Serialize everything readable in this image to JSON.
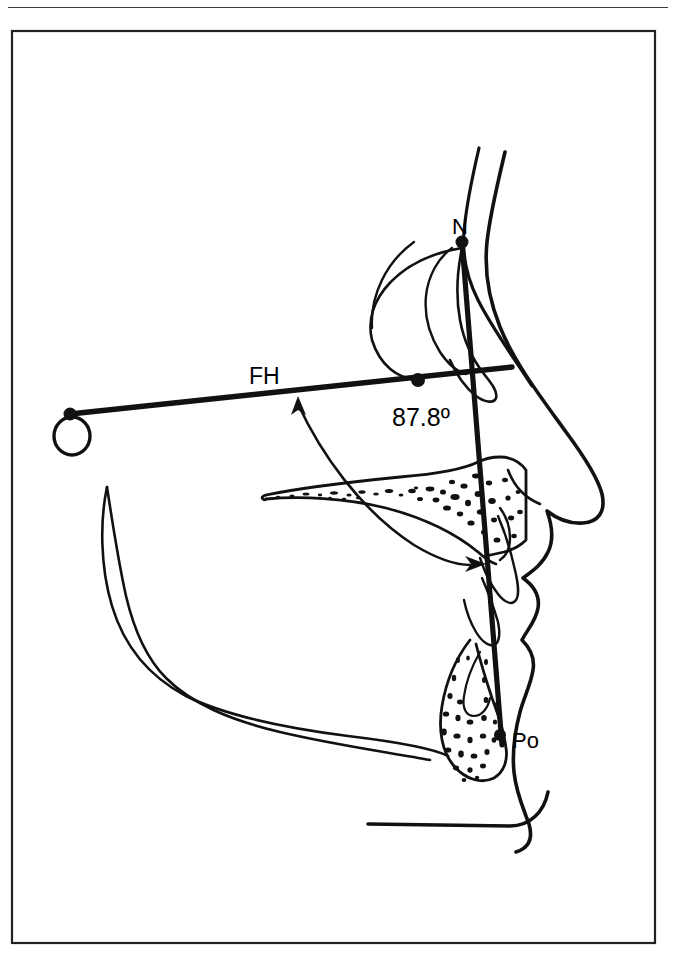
{
  "page": {
    "background_color": "#ffffff",
    "ink_color": "#111111",
    "header_rule": true,
    "frame": {
      "x": 12,
      "y": 31,
      "width": 643,
      "height": 912,
      "border_color": "#222222"
    }
  },
  "figure": {
    "kind": "cephalometric-lateral-tracing",
    "labels": [
      {
        "id": "n-label",
        "text": "N",
        "x": 452,
        "y": 234,
        "size": 22
      },
      {
        "id": "fh-label",
        "text": "FH",
        "x": 249,
        "y": 384,
        "size": 23
      },
      {
        "id": "angle-label",
        "text": "87.8º",
        "x": 392,
        "y": 426,
        "size": 25
      },
      {
        "id": "po-label",
        "text": "Po",
        "x": 512,
        "y": 748,
        "size": 22
      }
    ],
    "landmarks": [
      {
        "id": "nasion",
        "name": "N",
        "x": 462,
        "y": 242,
        "r": 6
      },
      {
        "id": "pogonion",
        "name": "Po",
        "x": 500,
        "y": 735,
        "r": 6
      },
      {
        "id": "fh-porion-end",
        "name": "FH-posterior",
        "x": 70,
        "y": 414,
        "r": 6
      },
      {
        "id": "fh-npo-intersection",
        "name": "FH-NPo crossing",
        "x": 418,
        "y": 380,
        "r": 7
      }
    ],
    "reference_lines": [
      {
        "id": "fh-plane",
        "name": "Frankfort Horizontal",
        "x1": 70,
        "y1": 414,
        "x2": 512,
        "y2": 367,
        "width": 5
      },
      {
        "id": "facial-plane",
        "name": "N-Po facial plane",
        "x1": 462,
        "y1": 242,
        "x2": 502,
        "y2": 745,
        "width": 5
      }
    ],
    "orbit_circle": {
      "id": "orbitale-ring",
      "cx": 72,
      "cy": 436,
      "rx": 18,
      "ry": 19
    },
    "angle_arc": {
      "id": "facial-angle-arc",
      "value": "87.8º",
      "path": "M 462 248 C 400 258, 362 300, 372 340 C 380 366, 398 378, 416 380"
    },
    "double_arrow": {
      "id": "facial-angle-arrow",
      "path": "M 296 399 C 320 450, 360 510, 415 545 C 445 562, 466 566, 482 564",
      "head_start": {
        "x": 296,
        "y": 399
      },
      "head_end": {
        "x": 482,
        "y": 564
      }
    }
  }
}
